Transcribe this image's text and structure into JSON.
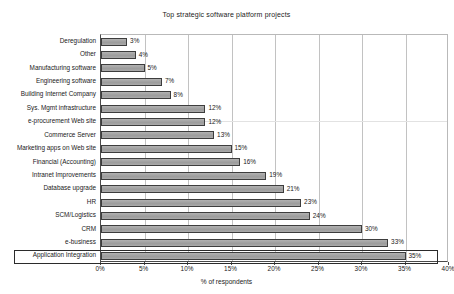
{
  "chart_data": {
    "type": "bar",
    "orientation": "horizontal",
    "title": "Top strategic software platform projects",
    "xlabel": "% of respondents",
    "ylabel": "",
    "xlim": [
      0,
      40
    ],
    "xticks": [
      "0%",
      "5%",
      "10%",
      "15%",
      "20%",
      "25%",
      "30%",
      "35%",
      "40%"
    ],
    "xtick_values": [
      0,
      5,
      10,
      15,
      20,
      25,
      30,
      35,
      40
    ],
    "grid": "vertical",
    "legend": "none",
    "categories": [
      "Deregulation",
      "Other",
      "Manufacturing software",
      "Engineering software",
      "Building Internet Company",
      "Sys. Mgmt infrastructure",
      "e-procurement Web site",
      "Commerce Server",
      "Marketing apps on Web site",
      "Financial (Accounting)",
      "Intranet Improvements",
      "Database upgrade",
      "HR",
      "SCM/Logistics",
      "CRM",
      "e-business",
      "Application Integration"
    ],
    "values": [
      3,
      4,
      5,
      7,
      8,
      12,
      12,
      13,
      15,
      16,
      19,
      21,
      23,
      24,
      30,
      33,
      35
    ],
    "data_labels": [
      "3%",
      "4%",
      "5%",
      "7%",
      "8%",
      "12%",
      "12%",
      "13%",
      "15%",
      "16%",
      "19%",
      "21%",
      "23%",
      "24%",
      "30%",
      "33%",
      "35%"
    ],
    "highlighted_category": "Application Integration",
    "colors": {
      "bar_fill": "#a6a6a6",
      "bar_border": "#3d3d3d",
      "gridline": "#c2c2c2",
      "axis": "#4a4a4a",
      "text": "#1a1a1a",
      "background": "#ffffff",
      "highlight_border": "#2b2b2b"
    }
  }
}
